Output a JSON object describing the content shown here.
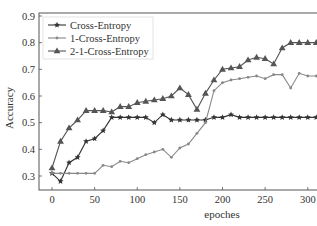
{
  "chart_data": {
    "type": "line",
    "title": "",
    "xlabel": "epoches",
    "ylabel": "Accuracy",
    "xlim": [
      -15,
      405
    ],
    "ylim": [
      0.25,
      0.9
    ],
    "xticks": [
      0,
      50,
      100,
      150,
      200,
      250,
      300,
      350,
      400
    ],
    "yticks": [
      0.3,
      0.4,
      0.5,
      0.6,
      0.7,
      0.8,
      0.9
    ],
    "grid": false,
    "legend_position": "upper left",
    "x": [
      0,
      10,
      20,
      30,
      40,
      50,
      60,
      70,
      80,
      90,
      100,
      110,
      120,
      130,
      140,
      150,
      160,
      170,
      180,
      190,
      200,
      210,
      220,
      230,
      240,
      250,
      260,
      270,
      280,
      290,
      300,
      310,
      320,
      330,
      340,
      350,
      360,
      370,
      380,
      390
    ],
    "series": [
      {
        "name": "Cross-Entropy",
        "marker": "star",
        "color": "#333333",
        "values": [
          0.31,
          0.28,
          0.35,
          0.37,
          0.43,
          0.44,
          0.47,
          0.52,
          0.52,
          0.52,
          0.52,
          0.52,
          0.5,
          0.53,
          0.51,
          0.51,
          0.51,
          0.51,
          0.51,
          0.52,
          0.52,
          0.53,
          0.52,
          0.52,
          0.52,
          0.52,
          0.52,
          0.52,
          0.52,
          0.52,
          0.52,
          0.52,
          0.52,
          0.53,
          0.52,
          0.52,
          0.52,
          0.53,
          0.52,
          0.52
        ]
      },
      {
        "name": "1-Cross-Entropy",
        "marker": "dot",
        "color": "#888888",
        "values": [
          0.31,
          0.31,
          0.31,
          0.31,
          0.31,
          0.31,
          0.34,
          0.335,
          0.355,
          0.35,
          0.365,
          0.38,
          0.39,
          0.4,
          0.37,
          0.405,
          0.42,
          0.46,
          0.5,
          0.62,
          0.65,
          0.66,
          0.665,
          0.67,
          0.675,
          0.665,
          0.68,
          0.68,
          0.63,
          0.685,
          0.675,
          0.675,
          0.685,
          0.675,
          0.675,
          0.675,
          0.675,
          0.675,
          0.67,
          0.67
        ]
      },
      {
        "name": "2-1-Cross-Entropy",
        "marker": "triangle",
        "color": "#555555",
        "values": [
          0.33,
          0.43,
          0.48,
          0.51,
          0.545,
          0.545,
          0.545,
          0.54,
          0.56,
          0.56,
          0.575,
          0.58,
          0.585,
          0.59,
          0.6,
          0.63,
          0.605,
          0.55,
          0.61,
          0.66,
          0.7,
          0.705,
          0.71,
          0.735,
          0.745,
          0.74,
          0.72,
          0.78,
          0.8,
          0.8,
          0.8,
          0.8,
          0.8,
          0.805,
          0.8,
          0.8,
          0.8,
          0.8,
          0.81,
          0.87
        ]
      }
    ]
  }
}
